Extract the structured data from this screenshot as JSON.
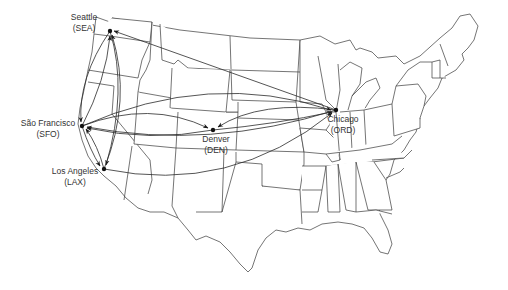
{
  "map": {
    "type": "route map",
    "region": "Contiguous United States",
    "line_color": "#2a2a2a",
    "background": "#ffffff"
  },
  "airports": [
    {
      "id": "SEA",
      "name": "Seattle",
      "code_label": "(SEA)",
      "x": 110,
      "y": 31
    },
    {
      "id": "SFO",
      "name": "São Francisco",
      "code_label": "(SFO)",
      "x": 82,
      "y": 126
    },
    {
      "id": "LAX",
      "name": "Los Angeles",
      "code_label": "(LAX)",
      "x": 104,
      "y": 169
    },
    {
      "id": "DEN",
      "name": "Denver",
      "code_label": "(DEN)",
      "x": 213,
      "y": 130
    },
    {
      "id": "ORD",
      "name": "Chicago",
      "code_label": "(ORD)",
      "x": 336,
      "y": 110
    }
  ],
  "routes": [
    {
      "from": "SEA",
      "to": "SFO"
    },
    {
      "from": "SFO",
      "to": "SEA"
    },
    {
      "from": "LAX",
      "to": "SEA"
    },
    {
      "from": "ORD",
      "to": "SEA"
    },
    {
      "from": "SEA",
      "to": "LAX"
    },
    {
      "from": "SFO",
      "to": "LAX"
    },
    {
      "from": "LAX",
      "to": "SFO"
    },
    {
      "from": "SFO",
      "to": "DEN"
    },
    {
      "from": "DEN",
      "to": "SFO"
    },
    {
      "from": "DEN",
      "to": "ORD"
    },
    {
      "from": "ORD",
      "to": "DEN"
    },
    {
      "from": "SFO",
      "to": "ORD"
    },
    {
      "from": "ORD",
      "to": "SFO"
    },
    {
      "from": "LAX",
      "to": "ORD"
    }
  ]
}
